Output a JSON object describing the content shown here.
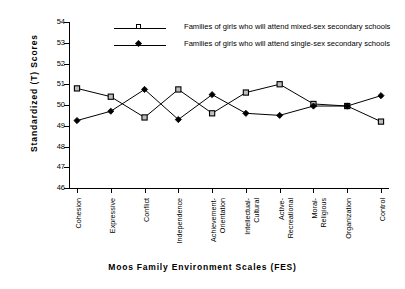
{
  "chart_data": {
    "type": "line",
    "title": "",
    "xlabel": "Moos  Family  Environment  Scales  (FES)",
    "ylabel": "Standardized  (T)  Scores",
    "ylim": [
      46,
      54
    ],
    "yticks": [
      46,
      47,
      48,
      49,
      50,
      51,
      52,
      53,
      54
    ],
    "grid": false,
    "legend_position": "top-center",
    "categories": [
      "Cohesion",
      "Expressive",
      "Conflict",
      "Independence",
      "Achievement-|Orientation",
      "Intellectual-|Cultural",
      "Active-|Recreational",
      "Moral-|Religious",
      "Organization",
      "Control"
    ],
    "series": [
      {
        "name": "Families of girls who will attend mixed-sex secondary schools",
        "marker": "open-square",
        "values": [
          50.8,
          50.4,
          49.4,
          50.75,
          49.6,
          50.6,
          51.0,
          50.05,
          49.95,
          49.2
        ]
      },
      {
        "name": "Families of girls who will attend single-sex secondary schools",
        "marker": "filled-diamond",
        "values": [
          49.25,
          49.7,
          50.75,
          49.3,
          50.5,
          49.6,
          49.5,
          49.95,
          49.95,
          50.45
        ]
      }
    ]
  },
  "legend": {
    "items": [
      {
        "label": "Families of girls who will attend mixed-sex secondary schools",
        "marker": "open-square"
      },
      {
        "label": "Families of girls who will attend single-sex secondary schools",
        "marker": "filled-diamond"
      }
    ]
  },
  "axis": {
    "y_title": "Standardized  (T)  Scores",
    "x_title": "Moos  Family  Environment  Scales  (FES)"
  }
}
